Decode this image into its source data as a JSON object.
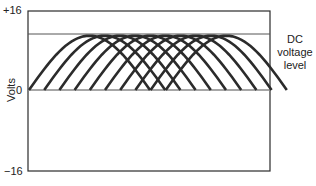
{
  "chart_data": {
    "type": "line",
    "title": "",
    "ylabel": "Volts",
    "xlabel": "",
    "ylim": [
      -16,
      16
    ],
    "y_ticks": [
      "+16",
      "0",
      "−16"
    ],
    "annotation": "DC voltage level",
    "dc_level": 11,
    "series_count": 10,
    "series": [
      {
        "name": "pulse-1",
        "start_offset": 0,
        "peak": 11
      },
      {
        "name": "pulse-2",
        "start_offset": 1,
        "peak": 11
      },
      {
        "name": "pulse-3",
        "start_offset": 2,
        "peak": 11
      },
      {
        "name": "pulse-4",
        "start_offset": 3,
        "peak": 11
      },
      {
        "name": "pulse-5",
        "start_offset": 4,
        "peak": 11
      },
      {
        "name": "pulse-6",
        "start_offset": 5,
        "peak": 11
      },
      {
        "name": "pulse-7",
        "start_offset": 6,
        "peak": 11
      },
      {
        "name": "pulse-8",
        "start_offset": 7,
        "peak": 11
      },
      {
        "name": "pulse-9",
        "start_offset": 8,
        "peak": 11
      },
      {
        "name": "pulse-10",
        "start_offset": 9,
        "peak": 11
      }
    ],
    "grid": false,
    "legend": "none"
  },
  "labels": {
    "y_top": "+16",
    "y_zero": "0",
    "y_bottom": "−16",
    "y_axis": "Volts",
    "dc_line1": "DC",
    "dc_line2": "voltage",
    "dc_line3": "level"
  },
  "colors": {
    "curve": "#2b2b2b",
    "frame": "#2b2b2b",
    "zero_line": "#888888",
    "dc_line": "#555555"
  }
}
